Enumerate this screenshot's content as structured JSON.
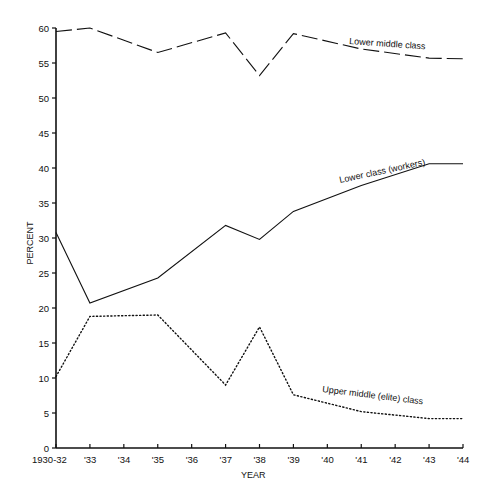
{
  "chart_data": {
    "type": "line",
    "title": "",
    "xlabel": "YEAR",
    "ylabel": "PERCENT",
    "ylim": [
      0,
      60
    ],
    "grid": false,
    "legend_position": "inline labels on lines",
    "yticks": [
      0,
      5,
      10,
      15,
      20,
      25,
      30,
      35,
      40,
      45,
      50,
      55,
      60
    ],
    "categories": [
      "1930-32",
      "'33",
      "'34",
      "'35",
      "'36",
      "'37",
      "'38",
      "'39",
      "'40",
      "'41",
      "'42",
      "'43",
      "'44"
    ],
    "series": [
      {
        "name": "Lower middle class",
        "style": "dashed",
        "x": [
          "1930-32",
          "'33",
          "'35",
          "'37",
          "'38",
          "'39",
          "'41",
          "'43",
          "'44"
        ],
        "values": [
          59.5,
          60,
          56.5,
          59.3,
          53.2,
          59.2,
          57,
          55.7,
          55.6
        ]
      },
      {
        "name": "Lower class (workers)",
        "style": "solid",
        "x": [
          "1930-32",
          "'33",
          "'35",
          "'37",
          "'38",
          "'39",
          "'41",
          "'43",
          "'44"
        ],
        "values": [
          30.8,
          20.7,
          24.3,
          31.8,
          29.8,
          33.8,
          37.5,
          40.6,
          40.6
        ]
      },
      {
        "name": "Upper middle (elite) class",
        "style": "dotted",
        "x": [
          "1930-32",
          "'33",
          "'35",
          "'37",
          "'38",
          "'39",
          "'41",
          "'43",
          "'44"
        ],
        "values": [
          10.2,
          18.8,
          19,
          9,
          17.3,
          7.6,
          5.2,
          4.2,
          4.2
        ]
      }
    ]
  },
  "colors": {
    "ink": "#111111",
    "background": "#ffffff"
  }
}
